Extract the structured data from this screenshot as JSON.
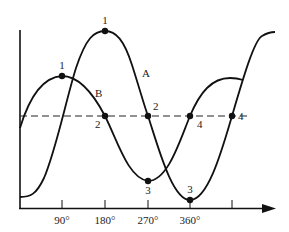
{
  "diagram": {
    "type": "phase-shifted sine waves",
    "curves": [
      {
        "name": "A",
        "label": "A",
        "points": [
          {
            "label": "1",
            "desc": "maximum",
            "angle": "180°"
          },
          {
            "label": "2",
            "desc": "midline crossing (falling)",
            "angle": "270°"
          },
          {
            "label": "3",
            "desc": "minimum",
            "angle": "360°"
          },
          {
            "label": "4",
            "desc": "midline crossing (rising)",
            "angle": "450°"
          }
        ]
      },
      {
        "name": "B",
        "label": "B",
        "points": [
          {
            "label": "1",
            "desc": "maximum",
            "angle": "90°"
          },
          {
            "label": "2",
            "desc": "midline crossing (falling)",
            "angle": "180°"
          },
          {
            "label": "3",
            "desc": "minimum",
            "angle": "270°"
          },
          {
            "label": "4",
            "desc": "midline crossing (rising)",
            "angle": "360°"
          }
        ]
      }
    ],
    "x_axis": {
      "ticks": [
        "90°",
        "180°",
        "270°",
        "360°",
        ""
      ]
    },
    "midline": "dashed"
  },
  "labels": {
    "curve_a": "A",
    "curve_b": "B",
    "a1": "1",
    "a2": "2",
    "a3": "3",
    "a4": "4",
    "b1": "1",
    "b2": "2",
    "b3": "3",
    "b4": "4",
    "tick_90": "90°",
    "tick_180": "180°",
    "tick_270": "270°",
    "tick_360": "360°"
  }
}
